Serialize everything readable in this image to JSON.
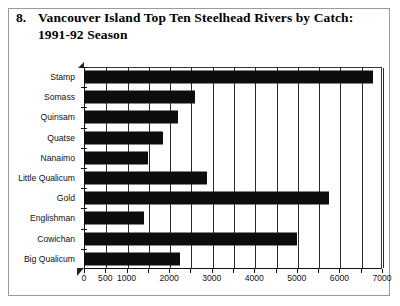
{
  "figure": {
    "number": "8.",
    "title": "Vancouver Island Top Ten Steelhead Rivers by Catch: 1991-92 Season"
  },
  "chart_data": {
    "type": "bar",
    "orientation": "horizontal",
    "title": "Vancouver Island Top Ten Steelhead Rivers by Catch: 1991-92 Season",
    "xlabel": "",
    "ylabel": "",
    "grid": true,
    "legend": false,
    "xlim": [
      0,
      7000
    ],
    "categories": [
      "Stamp",
      "Somass",
      "Quinsam",
      "Quatse",
      "Nanaimo",
      "Little Qualicum",
      "Gold",
      "Englishman",
      "Cowichan",
      "Big Qualicum"
    ],
    "values": [
      6800,
      2600,
      2200,
      1850,
      1500,
      2900,
      5750,
      1400,
      5000,
      2250
    ],
    "xticks": [
      0,
      500,
      1000,
      1500,
      2000,
      2500,
      3000,
      3500,
      4000,
      4500,
      5000,
      5500,
      6000,
      6500,
      7000
    ],
    "xtick_labels": [
      "0",
      "500",
      "1000",
      "",
      "2000",
      "",
      "3000",
      "",
      "4000",
      "",
      "5000",
      "",
      "6000",
      "",
      "7000"
    ],
    "bar_color": "#0d0d0d"
  }
}
